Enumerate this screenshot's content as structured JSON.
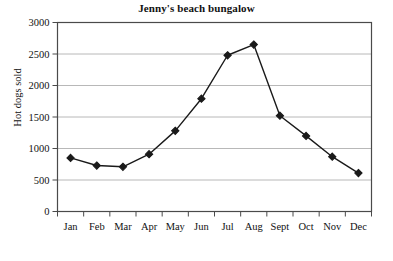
{
  "chart_data": {
    "type": "line",
    "title": "Jenny's beach bungalow",
    "xlabel": "",
    "ylabel": "Hot dogs sold",
    "categories": [
      "Jan",
      "Feb",
      "Mar",
      "Apr",
      "May",
      "Jun",
      "Jul",
      "Aug",
      "Sept",
      "Oct",
      "Nov",
      "Dec"
    ],
    "values": [
      850,
      730,
      710,
      910,
      1280,
      1790,
      2480,
      2650,
      1520,
      1200,
      870,
      610
    ],
    "series": [
      {
        "name": "Hot dogs sold",
        "values": [
          850,
          730,
          710,
          910,
          1280,
          1790,
          2480,
          2650,
          1520,
          1200,
          870,
          610
        ]
      }
    ],
    "ylim": [
      0,
      3000
    ],
    "yticks": [
      0,
      500,
      1000,
      1500,
      2000,
      2500,
      3000
    ],
    "ytick_labels": [
      "0",
      "500",
      "1000",
      "1500",
      "2000",
      "2500",
      "3000"
    ],
    "grid": "horizontal",
    "legend": "none",
    "marker": "diamond",
    "line_color": "#1a1a1a",
    "marker_color": "#1a1a1a",
    "grid_color": "#b8b8b8",
    "axis_color": "#4a4a4a",
    "background": "#ffffff"
  }
}
